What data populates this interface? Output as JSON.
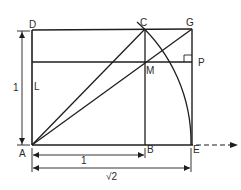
{
  "diagram": {
    "points": {
      "A": {
        "label": "A",
        "x": 32,
        "y": 145
      },
      "B": {
        "label": "B",
        "x": 145,
        "y": 145
      },
      "C": {
        "label": "C",
        "x": 145,
        "y": 29
      },
      "D": {
        "label": "D",
        "x": 32,
        "y": 30
      },
      "E": {
        "label": "E",
        "x": 191,
        "y": 145
      },
      "G": {
        "label": "G",
        "x": 192,
        "y": 29
      },
      "L": {
        "label": "L",
        "x": 32,
        "y": 62
      },
      "M": {
        "label": "M",
        "x": 145,
        "y": 62
      },
      "P": {
        "label": "P",
        "x": 192,
        "y": 62
      }
    },
    "dimensions": {
      "vertical_side": "1",
      "bottom_ab": "1",
      "bottom_ae": "√2"
    },
    "colors": {
      "line": "#1e1e1e",
      "background": "#ffffff"
    }
  }
}
